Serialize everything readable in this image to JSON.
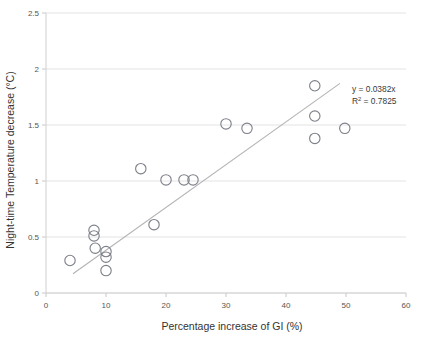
{
  "chart_data": {
    "type": "scatter",
    "title": "",
    "xlabel": "Percentage increase of GI (%)",
    "ylabel": "Night-time Temperature decrease (°C)",
    "xlim": [
      0,
      60
    ],
    "ylim": [
      0,
      2.5
    ],
    "xticks": [
      0,
      10,
      20,
      30,
      40,
      50,
      60
    ],
    "yticks": [
      0,
      0.5,
      1,
      1.5,
      2,
      2.5
    ],
    "xtick_labels": [
      "0",
      "10",
      "20",
      "30",
      "40",
      "50",
      "60"
    ],
    "ytick_labels": [
      "0",
      "0.5",
      "1",
      "1.5",
      "2",
      "2.5"
    ],
    "grid": "horizontal",
    "legend": "none",
    "marker_style": "open-circle",
    "points": [
      {
        "x": 4.0,
        "y": 0.29
      },
      {
        "x": 8.0,
        "y": 0.56
      },
      {
        "x": 8.0,
        "y": 0.51
      },
      {
        "x": 8.2,
        "y": 0.4
      },
      {
        "x": 10.0,
        "y": 0.37
      },
      {
        "x": 10.0,
        "y": 0.32
      },
      {
        "x": 10.0,
        "y": 0.2
      },
      {
        "x": 15.8,
        "y": 1.11
      },
      {
        "x": 18.0,
        "y": 0.61
      },
      {
        "x": 20.0,
        "y": 1.01
      },
      {
        "x": 23.0,
        "y": 1.01
      },
      {
        "x": 24.5,
        "y": 1.01
      },
      {
        "x": 30.0,
        "y": 1.51
      },
      {
        "x": 33.5,
        "y": 1.47
      },
      {
        "x": 44.8,
        "y": 1.85
      },
      {
        "x": 44.8,
        "y": 1.58
      },
      {
        "x": 44.8,
        "y": 1.38
      },
      {
        "x": 49.8,
        "y": 1.47
      }
    ],
    "trendline": {
      "type": "linear-through-origin",
      "slope": 0.0382,
      "intercept": 0,
      "r_squared": 0.7825,
      "x_start": 4.5,
      "x_end": 49.0,
      "equation_label": "y = 0.0382x",
      "r2_label_prefix": "R",
      "r2_label_sup": "2",
      "r2_label_suffix": " = 0.7825"
    }
  }
}
